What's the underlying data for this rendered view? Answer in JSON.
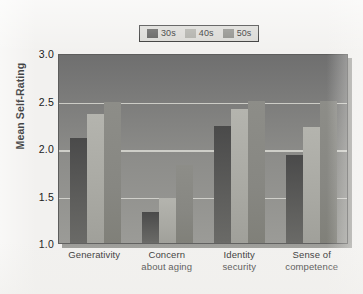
{
  "chart_data": {
    "type": "bar",
    "title": "",
    "xlabel": "",
    "ylabel": "Mean Self-Rating",
    "ylim": [
      1.0,
      3.0
    ],
    "yticks": [
      "3.0",
      "2.5",
      "2.0",
      "1.5",
      "1.0"
    ],
    "ytick_values": [
      3.0,
      2.5,
      2.0,
      1.5,
      1.0
    ],
    "grid": true,
    "legend_position": "top-center",
    "categories": [
      "Generativity",
      "Concern\nabout aging",
      "Identity\nsecurity",
      "Sense of\ncompetence"
    ],
    "category_lines": [
      [
        "Generativity",
        ""
      ],
      [
        "Concern",
        "about aging"
      ],
      [
        "Identity",
        "security"
      ],
      [
        "Sense of",
        "competence"
      ]
    ],
    "series": [
      {
        "name": "30s",
        "color": "#545452",
        "values": [
          2.11,
          1.33,
          2.23,
          1.93
        ]
      },
      {
        "name": "40s",
        "color": "#a9a9a3",
        "values": [
          2.36,
          1.47,
          2.41,
          2.22
        ]
      },
      {
        "name": "50s",
        "color": "#878782",
        "values": [
          2.48,
          1.82,
          2.5,
          2.5
        ]
      }
    ]
  },
  "legend": {
    "entries": [
      {
        "label": "30s"
      },
      {
        "label": "40s"
      },
      {
        "label": "50s"
      }
    ]
  },
  "colors": {
    "page_background": "#f2f1ef",
    "plot_background": "#8d8d8a",
    "gridline": "#d9d9d4",
    "legend_background": "#d8d7d3",
    "legend_border": "#2e2e2e",
    "text": "#1a1a1a"
  }
}
